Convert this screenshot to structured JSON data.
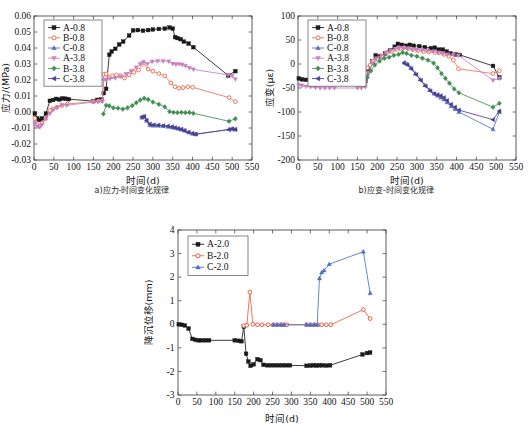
{
  "figure": {
    "clipped_header": "",
    "panels": [
      {
        "id": "a",
        "caption": "a)应力-时间变化规律",
        "xlabel": "时间(d)",
        "ylabel": "应力/(MPa)"
      },
      {
        "id": "b",
        "caption": "b)应变-时间变化规律",
        "xlabel": "时间(d)",
        "ylabel": "应变(με)"
      },
      {
        "id": "c",
        "caption": "",
        "xlabel": "时间(d)",
        "ylabel": "降沉位移(mm)"
      }
    ]
  },
  "chart_data": [
    {
      "type": "line",
      "panel": "a",
      "title": "a)应力-时间变化规律",
      "xlabel": "时间(d)",
      "ylabel": "应力/(MPa)",
      "xlim": [
        0,
        550
      ],
      "ylim": [
        -0.03,
        0.06
      ],
      "xticks": [
        0,
        50,
        100,
        150,
        200,
        250,
        300,
        350,
        400,
        450,
        500,
        550
      ],
      "yticks": [
        -0.03,
        -0.02,
        -0.01,
        0.0,
        0.01,
        0.02,
        0.03,
        0.04,
        0.05,
        0.06
      ],
      "ytick_labels": [
        "-0.03",
        "-0.02",
        "-0.01",
        "0.00",
        "0.01",
        "0.02",
        "0.03",
        "0.04",
        "0.05",
        "0.06"
      ],
      "grid": false,
      "legend_position": "upper-left",
      "series": [
        {
          "name": "A-0.8",
          "color": "#1a1a1a",
          "marker": "square",
          "x": [
            2,
            8,
            14,
            20,
            30,
            40,
            48,
            56,
            64,
            72,
            80,
            88,
            150,
            160,
            170,
            176,
            182,
            190,
            196,
            205,
            215,
            225,
            240,
            250,
            262,
            275,
            288,
            300,
            315,
            330,
            342,
            350,
            356,
            362,
            370,
            378,
            390,
            402,
            490,
            508
          ],
          "y": [
            -0.001,
            -0.004,
            -0.005,
            -0.004,
            -0.001,
            0.007,
            0.0075,
            0.0082,
            0.0078,
            0.0085,
            0.0083,
            0.008,
            0.0068,
            0.0076,
            0.0078,
            0.0118,
            0.0145,
            0.0358,
            0.0378,
            0.0395,
            0.0422,
            0.044,
            0.0478,
            0.051,
            0.0512,
            0.0508,
            0.0512,
            0.0516,
            0.0519,
            0.0521,
            0.0528,
            0.0521,
            0.0468,
            0.0462,
            0.0455,
            0.044,
            0.0428,
            0.0405,
            0.0228,
            0.0255
          ]
        },
        {
          "name": "B-0.8",
          "color": "#e8735a",
          "marker": "circle",
          "x": [
            2,
            8,
            14,
            20,
            30,
            40,
            48,
            58,
            70,
            84,
            150,
            162,
            172,
            176,
            182,
            190,
            198,
            208,
            218,
            228,
            240,
            252,
            264,
            276,
            288,
            300,
            315,
            330,
            345,
            356,
            366,
            376,
            388,
            400,
            492,
            508
          ],
          "y": [
            -0.004,
            -0.008,
            -0.009,
            -0.007,
            -0.004,
            0.001,
            0.002,
            0.003,
            0.004,
            0.005,
            0.0065,
            0.0068,
            0.007,
            0.0235,
            0.0238,
            0.0218,
            0.0226,
            0.0232,
            0.0228,
            0.0212,
            0.0232,
            0.0248,
            0.0262,
            0.0305,
            0.0268,
            0.0255,
            0.024,
            0.0226,
            0.0182,
            0.0158,
            0.0148,
            0.0152,
            0.0158,
            0.0155,
            0.009,
            0.0065
          ]
        },
        {
          "name": "C-0.8",
          "color": "#5a6fc0",
          "marker": "triangle",
          "x": [
            272,
            278,
            284,
            292,
            300,
            312,
            325,
            338,
            348,
            356,
            364,
            372,
            380,
            390,
            400,
            408,
            492,
            500,
            508
          ],
          "y": [
            -0.0036,
            -0.003,
            -0.0055,
            -0.0082,
            -0.0085,
            -0.0086,
            -0.0088,
            -0.0092,
            -0.0096,
            -0.01,
            -0.0104,
            -0.011,
            -0.0116,
            -0.0128,
            -0.0136,
            -0.014,
            -0.0108,
            -0.0105,
            -0.011
          ]
        },
        {
          "name": "A-3.8",
          "color": "#c87ec0",
          "marker": "triangle-down",
          "x": [
            2,
            8,
            14,
            20,
            30,
            40,
            48,
            58,
            70,
            82,
            150,
            162,
            172,
            176,
            182,
            192,
            205,
            218,
            232,
            245,
            258,
            268,
            276,
            286,
            298,
            312,
            326,
            340,
            350,
            358,
            366,
            374,
            382,
            392,
            402,
            490,
            500,
            508
          ],
          "y": [
            -0.007,
            -0.009,
            -0.0095,
            -0.008,
            -0.004,
            -0.001,
            0.0012,
            0.0028,
            0.0045,
            0.0042,
            0.0062,
            0.0064,
            0.0066,
            0.02,
            0.0202,
            0.0208,
            0.0212,
            0.022,
            0.0238,
            0.0256,
            0.0278,
            0.03,
            0.0312,
            0.03,
            0.0315,
            0.0318,
            0.0318,
            0.0316,
            0.0302,
            0.0298,
            0.03,
            0.0296,
            0.0288,
            0.0276,
            0.0266,
            0.0232,
            0.0226,
            0.0205
          ]
        },
        {
          "name": "B-3.8",
          "color": "#3f8f52",
          "marker": "diamond",
          "x": [
            175,
            182,
            190,
            200,
            212,
            224,
            236,
            248,
            258,
            268,
            278,
            288,
            300,
            315,
            330,
            342,
            352,
            362,
            372,
            382,
            392,
            402,
            492,
            508
          ],
          "y": [
            -0.0012,
            0.0042,
            0.0038,
            0.0026,
            0.0024,
            0.0018,
            0.0026,
            0.004,
            0.0058,
            0.0075,
            0.0086,
            0.0078,
            0.0062,
            0.0048,
            0.0032,
            0.0002,
            -0.0002,
            -0.0004,
            -0.0002,
            -0.0004,
            -0.0003,
            -0.0008,
            -0.0058,
            -0.0042
          ]
        },
        {
          "name": "C-3.8",
          "color": "#4a3f8f",
          "marker": "left-triangle",
          "x": [
            272,
            278,
            284,
            292,
            302,
            314,
            326,
            338,
            348,
            356,
            364,
            372,
            380,
            390,
            400,
            408,
            492,
            500,
            508
          ],
          "y": [
            -0.003,
            -0.0028,
            -0.0052,
            -0.0075,
            -0.008,
            -0.0082,
            -0.0085,
            -0.0088,
            -0.0092,
            -0.0098,
            -0.0104,
            -0.0108,
            -0.0116,
            -0.0126,
            -0.0134,
            -0.0138,
            -0.011,
            -0.0106,
            -0.0108
          ]
        }
      ]
    },
    {
      "type": "line",
      "panel": "b",
      "title": "b)应变-时间变化规律",
      "xlabel": "时间(d)",
      "ylabel": "应变(με)",
      "xlim": [
        0,
        550
      ],
      "ylim": [
        -200,
        100
      ],
      "xticks": [
        0,
        50,
        100,
        150,
        200,
        250,
        300,
        350,
        400,
        450,
        500,
        550
      ],
      "yticks": [
        -200,
        -150,
        -100,
        -50,
        0,
        50,
        100
      ],
      "ytick_labels": [
        "-200",
        "-150",
        "-100",
        "-50",
        "0",
        "50",
        "100"
      ],
      "grid": false,
      "legend_position": "upper-left",
      "series": [
        {
          "name": "A-0.8",
          "color": "#1a1a1a",
          "marker": "square",
          "x": [
            2,
            10,
            20,
            32,
            44,
            56,
            68,
            80,
            92,
            150,
            160,
            170,
            178,
            188,
            196,
            208,
            220,
            232,
            244,
            252,
            262,
            272,
            282,
            292,
            306,
            320,
            335,
            345,
            355,
            365,
            375,
            385,
            398,
            408,
            492,
            508
          ],
          "y": [
            -30,
            -32,
            -33,
            -35,
            -36,
            -37,
            -37,
            -38,
            -38,
            -38,
            -38,
            -36,
            -12,
            5,
            18,
            16,
            22,
            28,
            36,
            42,
            40,
            38,
            40,
            38,
            37,
            35,
            33,
            34,
            30,
            30,
            26,
            22,
            20,
            19,
            -4,
            -28
          ]
        },
        {
          "name": "B-0.8",
          "color": "#e8735a",
          "marker": "circle",
          "x": [
            175,
            182,
            190,
            200,
            212,
            224,
            236,
            248,
            258,
            268,
            278,
            290,
            302,
            316,
            330,
            345,
            356,
            368,
            380,
            392,
            405,
            492,
            508
          ],
          "y": [
            -8,
            -2,
            6,
            10,
            16,
            24,
            26,
            30,
            32,
            34,
            32,
            30,
            28,
            26,
            25,
            24,
            23,
            20,
            16,
            8,
            -10,
            -20,
            -14
          ]
        },
        {
          "name": "C-0.8",
          "color": "#5a6fc0",
          "marker": "triangle",
          "x": [
            268,
            276,
            285,
            296,
            308,
            320,
            332,
            344,
            352,
            360,
            368,
            376,
            386,
            396,
            406,
            492,
            508
          ],
          "y": [
            3,
            0,
            -8,
            -20,
            -32,
            -44,
            -54,
            -62,
            -66,
            -70,
            -74,
            -80,
            -88,
            -94,
            -100,
            -136,
            -100
          ]
        },
        {
          "name": "A-3.8",
          "color": "#c87ec0",
          "marker": "triangle-down",
          "x": [
            2,
            10,
            20,
            32,
            44,
            56,
            68,
            80,
            92,
            150,
            160,
            170,
            178,
            188,
            198,
            210,
            222,
            234,
            246,
            256,
            266,
            276,
            288,
            300,
            314,
            328,
            342,
            354,
            366,
            378,
            392,
            405,
            492,
            508
          ],
          "y": [
            -44,
            -45,
            -47,
            -48,
            -49,
            -50,
            -50,
            -50,
            -50,
            -50,
            -50,
            -48,
            -18,
            2,
            12,
            18,
            24,
            28,
            32,
            34,
            33,
            32,
            31,
            30,
            29,
            28,
            26,
            24,
            22,
            20,
            19,
            18,
            -34,
            -30
          ]
        },
        {
          "name": "B-3.8",
          "color": "#3f8f52",
          "marker": "diamond",
          "x": [
            175,
            184,
            194,
            206,
            218,
            230,
            242,
            254,
            264,
            274,
            286,
            300,
            314,
            328,
            342,
            352,
            362,
            372,
            382,
            394,
            406,
            492,
            508
          ],
          "y": [
            -28,
            -14,
            -2,
            6,
            12,
            14,
            18,
            20,
            24,
            22,
            18,
            16,
            12,
            8,
            2,
            -8,
            -20,
            -30,
            -40,
            -52,
            -60,
            -90,
            -82
          ]
        },
        {
          "name": "C-3.8",
          "color": "#4a3f8f",
          "marker": "left-triangle",
          "x": [
            268,
            276,
            286,
            298,
            310,
            322,
            334,
            344,
            352,
            360,
            368,
            376,
            386,
            396,
            406,
            492,
            508
          ],
          "y": [
            2,
            -2,
            -10,
            -22,
            -34,
            -46,
            -56,
            -62,
            -64,
            -66,
            -70,
            -76,
            -84,
            -90,
            -96,
            -116,
            -98
          ]
        }
      ]
    },
    {
      "type": "line",
      "panel": "c",
      "title": "",
      "xlabel": "时间(d)",
      "ylabel": "降沉位移(mm)",
      "xlim": [
        0,
        550
      ],
      "ylim": [
        -3,
        4
      ],
      "xticks": [
        0,
        50,
        100,
        150,
        200,
        250,
        300,
        350,
        400,
        450,
        500,
        550
      ],
      "yticks": [
        -3,
        -2,
        -1,
        0,
        1,
        2,
        3,
        4
      ],
      "ytick_labels": [
        "-3",
        "-2",
        "-1",
        "0",
        "1",
        "2",
        "3",
        "4"
      ],
      "grid": false,
      "legend_position": "upper-left",
      "series": [
        {
          "name": "A-2.0",
          "color": "#1a1a1a",
          "marker": "square",
          "x": [
            2,
            10,
            18,
            28,
            38,
            46,
            54,
            62,
            72,
            82,
            150,
            160,
            168,
            174,
            180,
            186,
            192,
            200,
            210,
            218,
            226,
            236,
            246,
            256,
            266,
            276,
            286,
            296,
            340,
            350,
            358,
            366,
            374,
            382,
            392,
            402,
            488,
            500,
            508
          ],
          "y": [
            0.0,
            -0.02,
            -0.05,
            -0.18,
            -0.62,
            -0.66,
            -0.68,
            -0.68,
            -0.68,
            -0.68,
            -0.68,
            -0.7,
            -0.72,
            -0.1,
            -1.25,
            -1.58,
            -1.76,
            -1.7,
            -1.48,
            -1.52,
            -1.72,
            -1.74,
            -1.74,
            -1.74,
            -1.74,
            -1.74,
            -1.74,
            -1.74,
            -1.76,
            -1.75,
            -1.74,
            -1.75,
            -1.74,
            -1.74,
            -1.75,
            -1.74,
            -1.28,
            -1.22,
            -1.2
          ]
        },
        {
          "name": "B-2.0",
          "color": "#e8603f",
          "marker": "circle",
          "x": [
            174,
            182,
            190,
            198,
            210,
            222,
            238,
            252,
            262,
            272,
            280,
            288,
            340,
            350,
            360,
            370,
            380,
            392,
            404,
            490,
            508
          ],
          "y": [
            -0.06,
            -0.04,
            1.36,
            0.0,
            -0.02,
            -0.02,
            -0.02,
            -0.02,
            -0.02,
            -0.02,
            -0.02,
            -0.02,
            -0.02,
            -0.02,
            -0.02,
            -0.02,
            -0.02,
            -0.02,
            -0.02,
            0.62,
            0.24
          ]
        },
        {
          "name": "C-2.0",
          "color": "#4a6fc8",
          "marker": "triangle",
          "x": [
            252,
            262,
            272,
            280,
            340,
            350,
            360,
            368,
            374,
            380,
            386,
            400,
            490,
            508
          ],
          "y": [
            -0.02,
            -0.02,
            -0.02,
            -0.02,
            -0.02,
            -0.02,
            -0.02,
            -0.02,
            1.95,
            2.2,
            2.28,
            2.55,
            3.08,
            1.32
          ]
        }
      ]
    }
  ]
}
